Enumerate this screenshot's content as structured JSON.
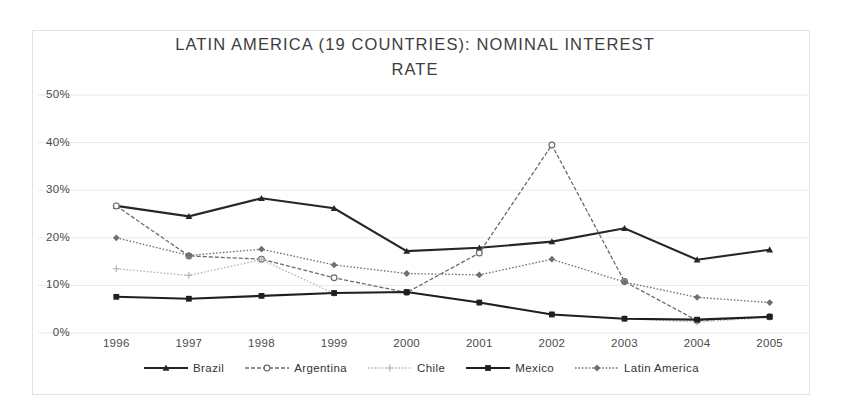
{
  "chart_data": {
    "type": "line",
    "title": "LATIN AMERICA (19 COUNTRIES): NOMINAL INTEREST\nRATE",
    "title_line1": "LATIN AMERICA (19 COUNTRIES): NOMINAL INTEREST",
    "title_line2": "RATE",
    "xlabel": "",
    "ylabel": "",
    "grid": true,
    "legend_position": "bottom",
    "x": [
      "1996",
      "1997",
      "1998",
      "1999",
      "2000",
      "2001",
      "2002",
      "2003",
      "2004",
      "2005"
    ],
    "categories": [
      "1996",
      "1997",
      "1998",
      "1999",
      "2000",
      "2001",
      "2002",
      "2003",
      "2004",
      "2005"
    ],
    "ylim": [
      0,
      50
    ],
    "yticks": [
      0,
      10,
      20,
      30,
      40,
      50
    ],
    "ytick_labels": [
      "0%",
      "10%",
      "20%",
      "30%",
      "40%",
      "50%"
    ],
    "series": [
      {
        "name": "Brazil",
        "color": "#262626",
        "style": "solid",
        "marker": "triangle",
        "values": [
          26.7,
          24.5,
          28.3,
          26.2,
          17.2,
          17.9,
          19.2,
          22.0,
          15.4,
          17.5
        ]
      },
      {
        "name": "Argentina",
        "color": "#6b6b6b",
        "style": "dashed",
        "marker": "circle",
        "values": [
          26.7,
          16.2,
          15.5,
          11.6,
          8.5,
          16.8,
          39.5,
          10.8,
          2.6,
          3.4
        ]
      },
      {
        "name": "Chile",
        "color": "#b5b5b5",
        "style": "dotted",
        "marker": "plus",
        "values": [
          13.5,
          12.1,
          15.4,
          8.3,
          8.6,
          6.4,
          3.9,
          3.0,
          2.3,
          3.3
        ]
      },
      {
        "name": "Mexico",
        "color": "#1f1f1f",
        "style": "solid",
        "marker": "square",
        "values": [
          7.6,
          7.2,
          7.8,
          8.4,
          8.6,
          6.4,
          3.9,
          3.0,
          2.8,
          3.4
        ]
      },
      {
        "name": "Latin America",
        "color": "#707070",
        "style": "dotted",
        "marker": "diamond",
        "values": [
          20.0,
          16.3,
          17.6,
          14.3,
          12.5,
          12.2,
          15.5,
          10.7,
          7.5,
          6.4
        ]
      }
    ]
  }
}
